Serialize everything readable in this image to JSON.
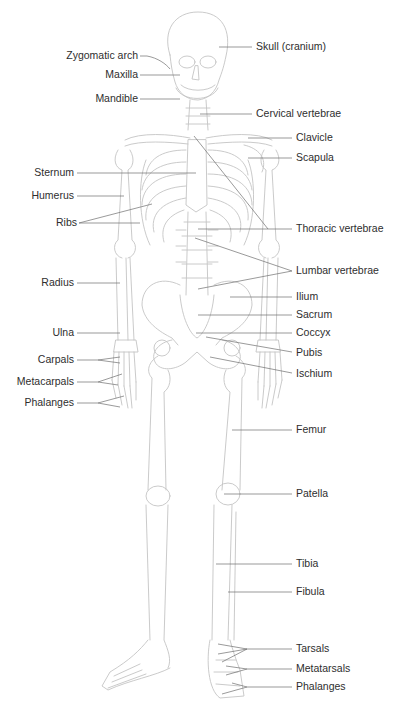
{
  "diagram": {
    "colors": {
      "background": "#ffffff",
      "bone_outline": "#c4c4c4",
      "leader_line": "#6e6e6e",
      "label_text": "#2e2e2e"
    },
    "labels_left": [
      {
        "id": "zygomatic-arch",
        "text": "Zygomatic arch",
        "x": 138,
        "y": 55
      },
      {
        "id": "maxilla",
        "text": "Maxilla",
        "x": 138,
        "y": 74
      },
      {
        "id": "mandible",
        "text": "Mandible",
        "x": 138,
        "y": 98
      },
      {
        "id": "sternum",
        "text": "Sternum",
        "x": 74,
        "y": 172
      },
      {
        "id": "humerus",
        "text": "Humerus",
        "x": 74,
        "y": 195
      },
      {
        "id": "ribs",
        "text": "Ribs",
        "x": 74,
        "y": 222
      },
      {
        "id": "radius",
        "text": "Radius",
        "x": 74,
        "y": 282
      },
      {
        "id": "ulna",
        "text": "Ulna",
        "x": 74,
        "y": 332
      },
      {
        "id": "carpals",
        "text": "Carpals",
        "x": 74,
        "y": 359
      },
      {
        "id": "metacarpals",
        "text": "Metacarpals",
        "x": 74,
        "y": 381
      },
      {
        "id": "phalanges-hand",
        "text": "Phalanges",
        "x": 74,
        "y": 402
      }
    ],
    "labels_right": [
      {
        "id": "skull",
        "text": "Skull (cranium)",
        "x": 256,
        "y": 46
      },
      {
        "id": "cervical-vertebrae",
        "text": "Cervical vertebrae",
        "x": 256,
        "y": 113
      },
      {
        "id": "clavicle",
        "text": "Clavicle",
        "x": 296,
        "y": 137
      },
      {
        "id": "scapula",
        "text": "Scapula",
        "x": 296,
        "y": 157
      },
      {
        "id": "thoracic-vertebrae",
        "text": "Thoracic vertebrae",
        "x": 296,
        "y": 228
      },
      {
        "id": "lumbar-vertebrae",
        "text": "Lumbar vertebrae",
        "x": 296,
        "y": 270
      },
      {
        "id": "ilium",
        "text": "Ilium",
        "x": 296,
        "y": 296
      },
      {
        "id": "sacrum",
        "text": "Sacrum",
        "x": 296,
        "y": 314
      },
      {
        "id": "coccyx",
        "text": "Coccyx",
        "x": 296,
        "y": 332
      },
      {
        "id": "pubis",
        "text": "Pubis",
        "x": 296,
        "y": 352
      },
      {
        "id": "ischium",
        "text": "Ischium",
        "x": 296,
        "y": 373
      },
      {
        "id": "femur",
        "text": "Femur",
        "x": 296,
        "y": 429
      },
      {
        "id": "patella",
        "text": "Patella",
        "x": 296,
        "y": 493
      },
      {
        "id": "tibia",
        "text": "Tibia",
        "x": 296,
        "y": 563
      },
      {
        "id": "fibula",
        "text": "Fibula",
        "x": 296,
        "y": 591
      },
      {
        "id": "tarsals",
        "text": "Tarsals",
        "x": 296,
        "y": 648
      },
      {
        "id": "metatarsals",
        "text": "Metatarsals",
        "x": 296,
        "y": 668
      },
      {
        "id": "phalanges-foot",
        "text": "Phalanges",
        "x": 296,
        "y": 686
      }
    ]
  }
}
